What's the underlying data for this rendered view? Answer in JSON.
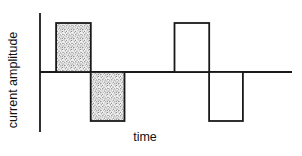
{
  "figure": {
    "background_color": "#ffffff"
  },
  "chart_data": {
    "type": "line",
    "subtype": "biphasic-square-pulse-waveform",
    "title": "",
    "xlabel": "time",
    "ylabel": "current amplitude",
    "x_range": [
      0,
      14.9
    ],
    "y_range": [
      -1.25,
      1.25
    ],
    "axes": {
      "x_ticks": [],
      "y_ticks": [],
      "grid": false,
      "baseline_value": 0
    },
    "colors": {
      "line": "#1a1a1a",
      "open_fill": "#ffffff",
      "stipple_background": "#f3f3f3",
      "stipple_dots": "#8a8a8a",
      "text": "#111111"
    },
    "pulses": [
      {
        "label": "stippled-positive-phase",
        "x_start": 0.95,
        "x_end": 3.0,
        "amplitude": 1,
        "fill": "stipple"
      },
      {
        "label": "stippled-negative-phase",
        "x_start": 3.0,
        "x_end": 5.0,
        "amplitude": -1,
        "fill": "stipple"
      },
      {
        "label": "open-positive-phase",
        "x_start": 7.95,
        "x_end": 10.0,
        "amplitude": 1,
        "fill": "white"
      },
      {
        "label": "open-negative-phase",
        "x_start": 10.0,
        "x_end": 12.0,
        "amplitude": -1,
        "fill": "white"
      }
    ]
  }
}
